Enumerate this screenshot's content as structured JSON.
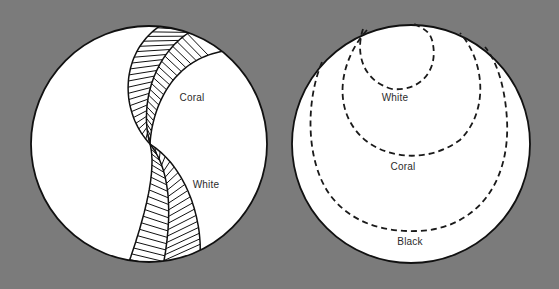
{
  "colors": {
    "background": "#7b7b7b",
    "disc_fill": "#ffffff",
    "ink": "#111111",
    "label_text": "#2b2b2b"
  },
  "left_diagram": {
    "description": "Circle with two twisted hatched bands crossing at center",
    "labels": [
      {
        "text": "Coral",
        "x": 192,
        "y": 97
      },
      {
        "text": "White",
        "x": 206,
        "y": 184
      }
    ]
  },
  "right_diagram": {
    "description": "Circle with three nested dashed loops hanging from the top",
    "labels": [
      {
        "text": "White",
        "x": 395,
        "y": 97
      },
      {
        "text": "Coral",
        "x": 403,
        "y": 166
      },
      {
        "text": "Black",
        "x": 410,
        "y": 241
      }
    ]
  }
}
